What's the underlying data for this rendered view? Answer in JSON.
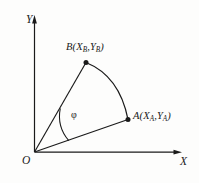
{
  "figure": {
    "background_color": "#fdfdfc",
    "stroke_color": "#1a1a1a",
    "axes": {
      "y_label": "Y",
      "x_label": "X",
      "origin_label": "O",
      "origin": [
        34,
        152
      ],
      "y_axis_top": [
        34,
        17
      ],
      "x_axis_right": [
        181,
        152
      ]
    },
    "points": [
      {
        "id": "B",
        "letter": "B",
        "label": "B(XB,YB)",
        "coord_x_text": "X",
        "coord_x_sub": "B",
        "coord_y_text": "Y",
        "coord_y_sub": "B",
        "position": [
          86,
          62
        ],
        "label_position": [
          66,
          42
        ]
      },
      {
        "id": "A",
        "letter": "A",
        "label": "A(XA,YA)",
        "coord_x_text": "X",
        "coord_x_sub": "A",
        "coord_y_text": "Y",
        "coord_y_sub": "A",
        "position": [
          128,
          119
        ],
        "label_position": [
          133,
          111
        ]
      }
    ],
    "angle": {
      "symbol": "φ",
      "name": "phi",
      "label_position": [
        71,
        110
      ],
      "arc_radius": 38
    },
    "arc_between_points": {
      "from": "B",
      "to": "A",
      "center": "O",
      "bulge": "outward"
    },
    "segments": [
      {
        "name": "radius-to-B",
        "from": "O",
        "to": "B"
      },
      {
        "name": "radius-to-A",
        "from": "O",
        "to": "A"
      }
    ]
  }
}
